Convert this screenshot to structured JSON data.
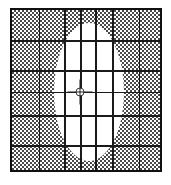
{
  "figure": {
    "title": "",
    "background_color": "#ffffff",
    "width": 171,
    "height": 185
  },
  "plot_frame": {
    "border_color": "#101010",
    "border_width": 2,
    "left": 10,
    "top": 8,
    "width": 152,
    "height": 164
  },
  "chart_data": {
    "type": "scatter",
    "title": "",
    "subtitle": "",
    "xlabel": "",
    "ylabel": "",
    "xlim": [
      0,
      152
    ],
    "ylim": [
      0,
      164
    ],
    "grid": true,
    "legend": null,
    "tick_labels": {
      "x": [],
      "y": []
    },
    "regions": [
      {
        "name": "shaded-region",
        "shape": "rectangle",
        "fill": "checkerboard-dither",
        "fill_color": "#4a4a4a",
        "background_color": "#ffffff",
        "cell_size_px": 2
      },
      {
        "name": "ellipse-region",
        "shape": "ellipse",
        "fill": "solid",
        "fill_color": "#ffffff",
        "center_x": 77,
        "center_y": 82,
        "semi_axis_x": 35,
        "semi_axis_y": 69
      }
    ],
    "gridlines": {
      "color": "#1a1a1a",
      "vertical_x": [
        27,
        52,
        68,
        83,
        100,
        127
      ],
      "vertical_major_x": [
        52,
        68,
        83,
        100
      ],
      "horizontal_y": [
        30,
        60,
        82,
        105,
        135
      ],
      "horizontal_major_y": [
        30,
        60,
        105,
        135
      ]
    },
    "markers": [
      {
        "name": "center-marker",
        "shape": "crosshair-circle",
        "x": 68,
        "y": 82,
        "color": "#202020"
      }
    ]
  }
}
